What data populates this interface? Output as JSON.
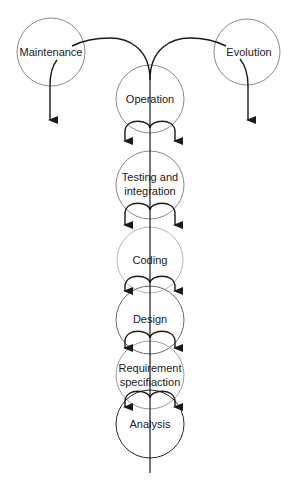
{
  "diagram": {
    "type": "software-lifecycle-spiral",
    "colors": {
      "background": "#ffffff",
      "circle_stroke": "#8a8a8a",
      "circle_stroke_light": "#b5b5b5",
      "circle_stroke_dark": "#2a2a2a",
      "arrow": "#1a1a1a",
      "text": "#1a1a1a"
    },
    "nodes": [
      {
        "id": "maintenance",
        "label": [
          "Maintenance"
        ],
        "cx": 51,
        "cy": 52,
        "r": 34
      },
      {
        "id": "evolution",
        "label": [
          "Evolution"
        ],
        "cx": 247,
        "cy": 52,
        "r": 33
      },
      {
        "id": "operation",
        "label": [
          "Operation"
        ],
        "cx": 150,
        "cy": 99,
        "r": 34
      },
      {
        "id": "testing",
        "label": [
          "Testing and",
          "integration"
        ],
        "cx": 150,
        "cy": 185,
        "r": 34
      },
      {
        "id": "coding",
        "label": [
          "Coding"
        ],
        "cx": 150,
        "cy": 260,
        "r": 33
      },
      {
        "id": "design",
        "label": [
          "Design"
        ],
        "cx": 150,
        "cy": 320,
        "r": 34
      },
      {
        "id": "requirement",
        "label": [
          "Requirement",
          "specifiaction"
        ],
        "cx": 150,
        "cy": 375,
        "r": 34
      },
      {
        "id": "analysis",
        "label": [
          "Analysis"
        ],
        "cx": 150,
        "cy": 424,
        "r": 34
      }
    ],
    "edges": [
      {
        "from": "operation",
        "to": "maintenance",
        "kind": "curved"
      },
      {
        "from": "operation",
        "to": "evolution",
        "kind": "curved"
      },
      {
        "from": "maintenance",
        "to": "down",
        "kind": "arrow"
      },
      {
        "from": "evolution",
        "to": "down",
        "kind": "arrow"
      },
      {
        "from": "analysis",
        "to": "requirement",
        "kind": "split-arrows"
      },
      {
        "from": "requirement",
        "to": "design",
        "kind": "split-arrows"
      },
      {
        "from": "design",
        "to": "coding",
        "kind": "split-arrows"
      },
      {
        "from": "coding",
        "to": "testing",
        "kind": "split-arrows"
      },
      {
        "from": "testing",
        "to": "operation",
        "kind": "split-arrows"
      }
    ]
  },
  "labels": {
    "maintenance": "Maintenance",
    "evolution": "Evolution",
    "operation": "Operation",
    "testing_1": "Testing and",
    "testing_2": "integration",
    "coding": "Coding",
    "design": "Design",
    "requirement_1": "Requirement",
    "requirement_2": "specifiaction",
    "analysis": "Analysis"
  }
}
